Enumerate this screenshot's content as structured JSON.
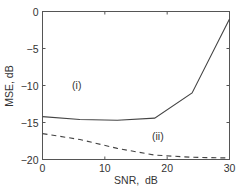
{
  "chart_data": {
    "type": "line",
    "title": "",
    "xlabel": "SNR,  dB",
    "ylabel": "MSE, dB",
    "xlim": [
      0,
      30
    ],
    "ylim": [
      -20,
      0
    ],
    "xticks": [
      0,
      10,
      20,
      30
    ],
    "yticks": [
      0,
      -5,
      -10,
      -15,
      -20
    ],
    "grid": false,
    "legend": null,
    "series": [
      {
        "name": "(i)",
        "style": "solid",
        "color": "#444444",
        "x": [
          0,
          6,
          12,
          18,
          24,
          30
        ],
        "y": [
          -14.2,
          -14.6,
          -14.7,
          -14.4,
          -11.0,
          -1.0
        ]
      },
      {
        "name": "(ii)",
        "style": "dashed",
        "color": "#444444",
        "x": [
          0,
          6,
          12,
          18,
          24,
          30
        ],
        "y": [
          -16.5,
          -17.3,
          -18.5,
          -19.4,
          -19.7,
          -19.8
        ]
      }
    ],
    "annotations": [
      {
        "text": "(i)",
        "x": 5.5,
        "y": -10.5
      },
      {
        "text": "(ii)",
        "x": 18.5,
        "y": -17.3
      }
    ]
  }
}
